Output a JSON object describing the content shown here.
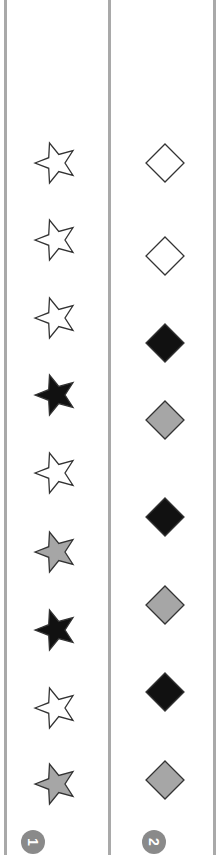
{
  "colors": {
    "white": "#ffffff",
    "black": "#111111",
    "gray": "#a6a6a6",
    "stroke": "#333333",
    "divider": "#a9a9a9",
    "badge": "#8a8a8a"
  },
  "columns": [
    {
      "id": 1,
      "shape": "star",
      "badge_label": "1",
      "items": [
        {
          "fill": "white",
          "y": 163
        },
        {
          "fill": "white",
          "y": 240
        },
        {
          "fill": "white",
          "y": 318
        },
        {
          "fill": "black",
          "y": 395
        },
        {
          "fill": "white",
          "y": 473
        },
        {
          "fill": "gray",
          "y": 552
        },
        {
          "fill": "black",
          "y": 630
        },
        {
          "fill": "white",
          "y": 708
        },
        {
          "fill": "gray",
          "y": 784
        }
      ]
    },
    {
      "id": 2,
      "shape": "diamond",
      "badge_label": "2",
      "items": [
        {
          "fill": "white",
          "y": 163
        },
        {
          "fill": "white",
          "y": 256
        },
        {
          "fill": "black",
          "y": 343
        },
        {
          "fill": "gray",
          "y": 420
        },
        {
          "fill": "black",
          "y": 517
        },
        {
          "fill": "gray",
          "y": 605
        },
        {
          "fill": "black",
          "y": 692
        },
        {
          "fill": "gray",
          "y": 780
        }
      ]
    }
  ]
}
